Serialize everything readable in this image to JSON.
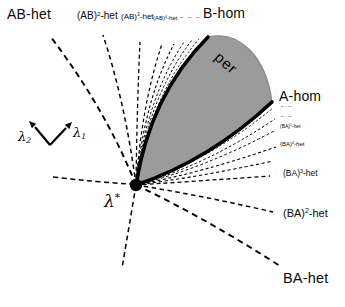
{
  "colors": {
    "background": "#ffffff",
    "region_fill": "#9b9b9b",
    "region_edge": "#8a8a8a",
    "curve": "#000000"
  },
  "region": {
    "label": "per"
  },
  "point": {
    "base": "λ",
    "sup": "*"
  },
  "axes": {
    "lambda1": {
      "base": "λ",
      "sub": "1"
    },
    "lambda2": {
      "base": "λ",
      "sub": "2"
    }
  },
  "top_labels": {
    "ab_het": "AB-het",
    "ab2": {
      "pre": "(AB)",
      "sup": "2",
      "post": "-het"
    },
    "ab3": {
      "pre": "(AB)",
      "sup": "3",
      "post": "-het"
    },
    "ab4": {
      "pre": "(AB)",
      "sup": "4",
      "post": "-het"
    },
    "dots": "– – – –",
    "b_hom": "B-hom"
  },
  "right_labels": {
    "a_hom": "A-hom",
    "dots1": "–·–",
    "dots2": "–·–",
    "ba5": {
      "pre": "(BA)",
      "sup": "5",
      "post": "-het"
    },
    "ba4": {
      "pre": "(BA)",
      "sup": "4",
      "post": "-het"
    },
    "ba3": {
      "pre": "(BA)",
      "sup": "3",
      "post": "-het"
    },
    "ba2": {
      "pre": "(BA)",
      "sup": "2",
      "post": "-het"
    },
    "ba_het": "BA-het"
  }
}
